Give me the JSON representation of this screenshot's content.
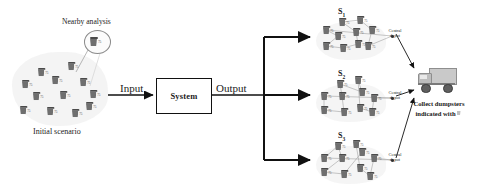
{
  "diagram": {
    "flow": {
      "input_label": "Input",
      "system_label": "System",
      "output_label": "Output"
    },
    "left_panel": {
      "caption": "Initial scenario",
      "callout_label": "Nearby analysis",
      "callout_icon": "dumpster-icon",
      "dumpster_icon_label": "75",
      "dumpster_count": 12,
      "dumpsters": [
        {
          "x": 24,
          "y": 14,
          "label": "75"
        },
        {
          "x": 54,
          "y": 8,
          "label": "75"
        },
        {
          "x": 8,
          "y": 26,
          "label": "75"
        },
        {
          "x": 38,
          "y": 22,
          "label": "75"
        },
        {
          "x": 66,
          "y": 24,
          "label": "75"
        },
        {
          "x": 19,
          "y": 38,
          "label": "75"
        },
        {
          "x": 46,
          "y": 37,
          "label": "75"
        },
        {
          "x": 76,
          "y": 36,
          "label": "75"
        },
        {
          "x": 6,
          "y": 52,
          "label": "75"
        },
        {
          "x": 33,
          "y": 53,
          "label": "75"
        },
        {
          "x": 58,
          "y": 55,
          "label": "75"
        },
        {
          "x": 72,
          "y": 48,
          "label": "75"
        }
      ]
    },
    "scenarios": [
      {
        "id": "s1",
        "title": "S",
        "subscript": "1",
        "depot_label_line1": "Central",
        "depot_label_line2": "depot",
        "node_label": "75",
        "nodes": [
          {
            "x": 14,
            "y": 22
          },
          {
            "x": 30,
            "y": 14
          },
          {
            "x": 48,
            "y": 12
          },
          {
            "x": 26,
            "y": 28
          },
          {
            "x": 44,
            "y": 24
          },
          {
            "x": 60,
            "y": 22
          },
          {
            "x": 14,
            "y": 38
          },
          {
            "x": 31,
            "y": 40
          },
          {
            "x": 46,
            "y": 36
          },
          {
            "x": 56,
            "y": 38
          }
        ]
      },
      {
        "id": "s2",
        "title": "S",
        "subscript": "2",
        "depot_label_line1": "Central",
        "depot_label_line2": "depot",
        "node_label": "75",
        "nodes": [
          {
            "x": 12,
            "y": 26
          },
          {
            "x": 28,
            "y": 14
          },
          {
            "x": 46,
            "y": 10
          },
          {
            "x": 30,
            "y": 26
          },
          {
            "x": 50,
            "y": 22
          },
          {
            "x": 62,
            "y": 28
          },
          {
            "x": 12,
            "y": 40
          },
          {
            "x": 32,
            "y": 42
          },
          {
            "x": 48,
            "y": 38
          },
          {
            "x": 60,
            "y": 42
          }
        ]
      },
      {
        "id": "s3",
        "title": "S",
        "subscript": "3",
        "depot_label_line1": "Central",
        "depot_label_line2": "depot",
        "node_label": "75",
        "nodes": [
          {
            "x": 12,
            "y": 26
          },
          {
            "x": 26,
            "y": 14
          },
          {
            "x": 44,
            "y": 12
          },
          {
            "x": 30,
            "y": 26
          },
          {
            "x": 50,
            "y": 20
          },
          {
            "x": 62,
            "y": 26
          },
          {
            "x": 12,
            "y": 40
          },
          {
            "x": 32,
            "y": 42
          },
          {
            "x": 48,
            "y": 36
          },
          {
            "x": 58,
            "y": 44
          }
        ]
      }
    ],
    "output_panel": {
      "truck_icon": "collection-truck-icon",
      "caption_line1": "Collect dumpsters",
      "caption_line2": "indicated with"
    },
    "colors": {
      "stroke": "#111111",
      "cloud": "#f2f2f2",
      "node": "#6f6f6f",
      "route": "#9a9a9a",
      "truck_body": "#c9c9c9"
    }
  }
}
